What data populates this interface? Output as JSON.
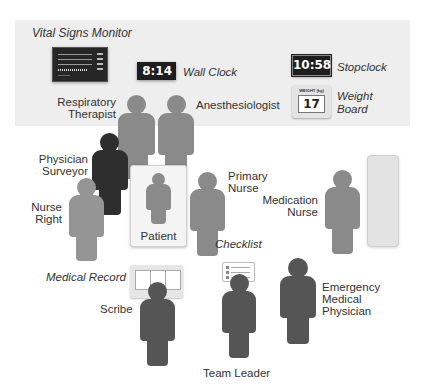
{
  "diagram": {
    "equipment": {
      "vital_signs_monitor": {
        "label": "Vital Signs Monitor"
      },
      "wall_clock": {
        "label": "Wall Clock",
        "time": "8:14"
      },
      "stopclock": {
        "label": "Stopclock",
        "time": "10:58"
      },
      "weight_board": {
        "label_line1": "Weight",
        "label_line2": "Board",
        "caption": "WEIGHT (kg)",
        "value": "17"
      },
      "medical_record": {
        "label": "Medical Record"
      },
      "checklist": {
        "label": "Checklist"
      }
    },
    "patient": {
      "label": "Patient"
    },
    "roles": {
      "respiratory_therapist": {
        "line1": "Respiratory",
        "line2": "Therapist"
      },
      "anesthesiologist": {
        "line1": "Anesthesiologist"
      },
      "physician_surveyor": {
        "line1": "Physician",
        "line2": "Surveyor"
      },
      "nurse_right": {
        "line1": "Nurse",
        "line2": "Right"
      },
      "primary_nurse": {
        "line1": "Primary",
        "line2": "Nurse"
      },
      "medication_nurse": {
        "line1": "Medication",
        "line2": "Nurse"
      },
      "scribe": {
        "line1": "Scribe"
      },
      "team_leader": {
        "line1": "Team Leader"
      },
      "emergency_medical_physician": {
        "line1": "Emergency",
        "line2": "Medical",
        "line3": "Physician"
      }
    },
    "colors": {
      "band": "#eeeeee",
      "figure_mid": "#8a8a8a",
      "figure_dark": "#2e2e2e",
      "figure_darkgray": "#555555",
      "clock_bg": "#1e1e1e"
    }
  }
}
